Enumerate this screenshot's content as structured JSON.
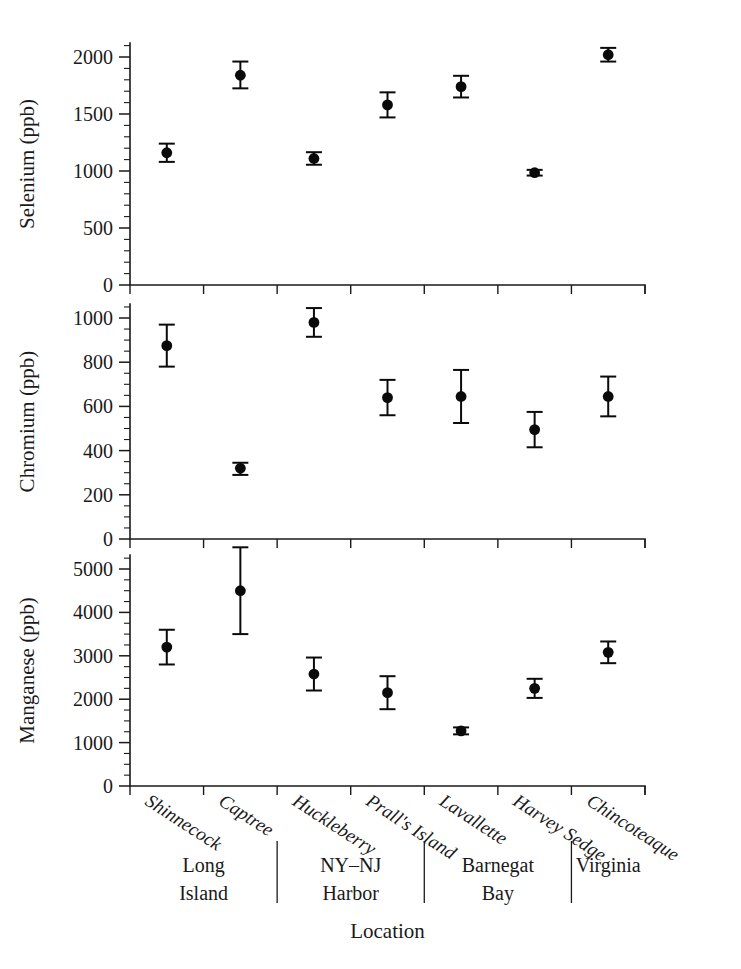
{
  "figure": {
    "xlabel": "Location",
    "background": "#ffffff",
    "marker_color": "#0a0a0a",
    "axis_color": "#1a1a1a"
  },
  "categories": [
    "Shinnecock",
    "Captree",
    "Huckleberry",
    "Prall's Island",
    "Lavallette",
    "Harvey Sedge",
    "Chincoteaque"
  ],
  "groups": [
    {
      "label_line1": "Long",
      "label_line2": "Island",
      "members": [
        "Shinnecock",
        "Captree"
      ]
    },
    {
      "label_line1": "NY–NJ",
      "label_line2": "Harbor",
      "members": [
        "Huckleberry",
        "Prall's Island"
      ]
    },
    {
      "label_line1": "Barnegat",
      "label_line2": "Bay",
      "members": [
        "Lavallette",
        "Harvey Sedge"
      ]
    },
    {
      "label_line1": "Virginia",
      "label_line2": "",
      "members": [
        "Chincoteaque"
      ]
    }
  ],
  "chart_data": [
    {
      "type": "scatter",
      "panel": "top",
      "title": "",
      "ylabel": "Selenium (ppb)",
      "xlabel": "Location",
      "ylim": [
        0,
        2100
      ],
      "yticks": [
        0,
        500,
        1000,
        1500,
        2000
      ],
      "ytick_labels": [
        "0",
        "500",
        "1000",
        "1500",
        "2000"
      ],
      "yminor_step": 100,
      "grid": false,
      "legend": "none",
      "categories": [
        "Shinnecock",
        "Captree",
        "Huckleberry",
        "Prall's Island",
        "Lavallette",
        "Harvey Sedge",
        "Chincoteaque"
      ],
      "values": [
        1160,
        1840,
        1110,
        1580,
        1740,
        985,
        2020
      ],
      "err_low": [
        80,
        115,
        55,
        110,
        95,
        25,
        60
      ],
      "err_high": [
        80,
        120,
        55,
        110,
        95,
        25,
        60
      ]
    },
    {
      "type": "scatter",
      "panel": "middle",
      "title": "",
      "ylabel": "Chromium (ppb)",
      "xlabel": "Location",
      "ylim": [
        0,
        1100
      ],
      "yticks": [
        0,
        200,
        400,
        600,
        800,
        1000
      ],
      "ytick_labels": [
        "0",
        "200",
        "400",
        "600",
        "800",
        "1000"
      ],
      "yminor_step": 50,
      "grid": false,
      "legend": "none",
      "categories": [
        "Shinnecock",
        "Captree",
        "Huckleberry",
        "Prall's Island",
        "Lavallette",
        "Harvey Sedge",
        "Chincoteaque"
      ],
      "values": [
        875,
        320,
        980,
        640,
        645,
        495,
        645
      ],
      "err_low": [
        95,
        30,
        65,
        80,
        120,
        80,
        90
      ],
      "err_high": [
        95,
        25,
        65,
        80,
        120,
        80,
        90
      ]
    },
    {
      "type": "scatter",
      "panel": "bottom",
      "title": "",
      "ylabel": "Manganese (ppb)",
      "xlabel": "Location",
      "ylim": [
        0,
        5600
      ],
      "yticks": [
        0,
        1000,
        2000,
        3000,
        4000,
        5000
      ],
      "ytick_labels": [
        "0",
        "1000",
        "2000",
        "3000",
        "4000",
        "5000"
      ],
      "yminor_step": 250,
      "grid": false,
      "legend": "none",
      "categories": [
        "Shinnecock",
        "Captree",
        "Huckleberry",
        "Prall's Island",
        "Lavallette",
        "Harvey Sedge",
        "Chincoteaque"
      ],
      "values": [
        3200,
        4500,
        2580,
        2150,
        1270,
        2250,
        3080
      ],
      "err_low": [
        400,
        1000,
        380,
        380,
        80,
        220,
        250
      ],
      "err_high": [
        400,
        1000,
        380,
        380,
        80,
        220,
        250
      ]
    }
  ]
}
